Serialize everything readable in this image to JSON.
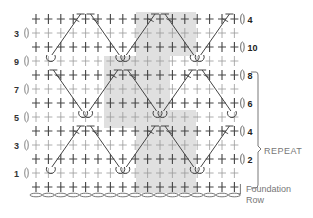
{
  "diagram": {
    "type": "crochet-stitch-chart",
    "columns": 17,
    "rows": 13,
    "shade_color": "#e0e0e0",
    "ink_color": "#444444",
    "left_row_labels": [
      {
        "label": "3",
        "row": 1
      },
      {
        "label": "9",
        "row": 3
      },
      {
        "label": "7",
        "row": 5
      },
      {
        "label": "5",
        "row": 7
      },
      {
        "label": "3",
        "row": 9
      },
      {
        "label": "1",
        "row": 11
      }
    ],
    "right_row_labels": [
      {
        "label": "4",
        "row": 0
      },
      {
        "label": "10",
        "row": 2
      },
      {
        "label": "8",
        "row": 4
      },
      {
        "label": "6",
        "row": 6
      },
      {
        "label": "4",
        "row": 8
      },
      {
        "label": "2",
        "row": 10
      }
    ],
    "repeat_label": "REPEAT",
    "foundation_label_line1": "Foundation",
    "foundation_label_line2": "Row",
    "legend_symbols": [
      "single-crochet-cross",
      "chain-oval",
      "front-post-treble-diagonal",
      "loop-base"
    ]
  }
}
